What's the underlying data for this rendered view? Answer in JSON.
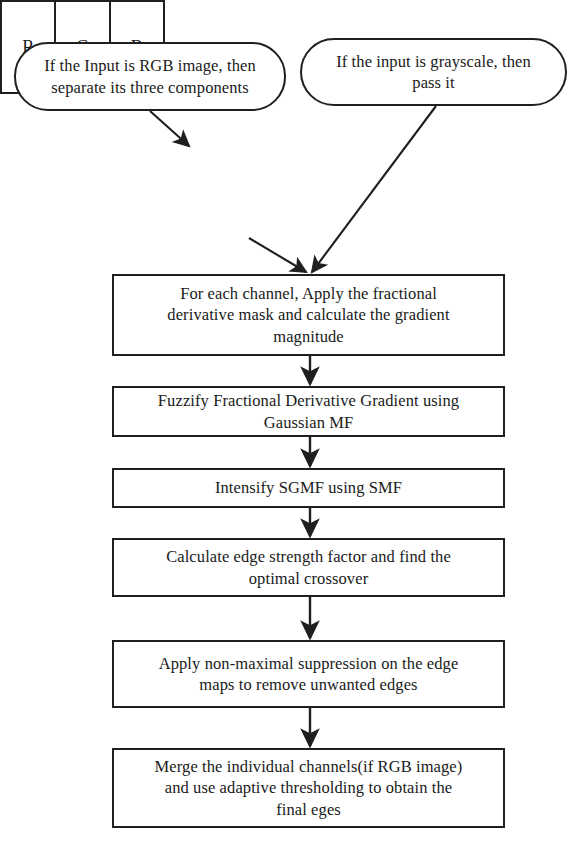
{
  "diagram": {
    "stroke_color": "#1f1f1f",
    "fill_color": "#ffffff",
    "text_color": "#1a1a1a"
  },
  "terminators": {
    "rgb_input": {
      "label": "If the Input is RGB image, then\nseparate its three components",
      "shape": "rounded-rectangle"
    },
    "grayscale_input": {
      "label": "If the input is grayscale, then\npass it",
      "shape": "rounded-rectangle"
    }
  },
  "channel_box": {
    "name": "rgb-channel-split",
    "cells": [
      {
        "label": "R"
      },
      {
        "label": "G"
      },
      {
        "label": "B"
      }
    ]
  },
  "process_steps": [
    {
      "id": "proc-1",
      "label": "For each channel, Apply the fractional\nderivative mask and calculate the gradient\nmagnitude"
    },
    {
      "id": "proc-2",
      "label": "Fuzzify Fractional Derivative Gradient using\nGaussian MF"
    },
    {
      "id": "proc-3",
      "label": "Intensify SGMF using SMF"
    },
    {
      "id": "proc-4",
      "label": "Calculate edge strength factor and find the\noptimal crossover"
    },
    {
      "id": "proc-5",
      "label": "Apply non-maximal suppression on the edge\nmaps to remove unwanted edges"
    },
    {
      "id": "proc-6",
      "label": "Merge the individual channels(if RGB image)\nand use adaptive thresholding to obtain the\nfinal eges"
    }
  ],
  "connectors": [
    {
      "name": "rgb-terminator-to-channel-box",
      "from": "term-rgb",
      "to": "channel-box",
      "style": "diagonal-arrow"
    },
    {
      "name": "channel-box-to-proc-1",
      "from": "channel-box",
      "to": "proc-1",
      "style": "diagonal-arrow"
    },
    {
      "name": "grayscale-terminator-to-proc-1",
      "from": "term-gray",
      "to": "proc-1",
      "style": "diagonal-arrow"
    },
    {
      "name": "proc-1-to-proc-2",
      "from": "proc-1",
      "to": "proc-2",
      "style": "vertical-arrow"
    },
    {
      "name": "proc-2-to-proc-3",
      "from": "proc-2",
      "to": "proc-3",
      "style": "vertical-arrow"
    },
    {
      "name": "proc-3-to-proc-4",
      "from": "proc-3",
      "to": "proc-4",
      "style": "vertical-arrow"
    },
    {
      "name": "proc-4-to-proc-5",
      "from": "proc-4",
      "to": "proc-5",
      "style": "vertical-arrow"
    },
    {
      "name": "proc-5-to-proc-6",
      "from": "proc-5",
      "to": "proc-6",
      "style": "vertical-arrow"
    }
  ]
}
